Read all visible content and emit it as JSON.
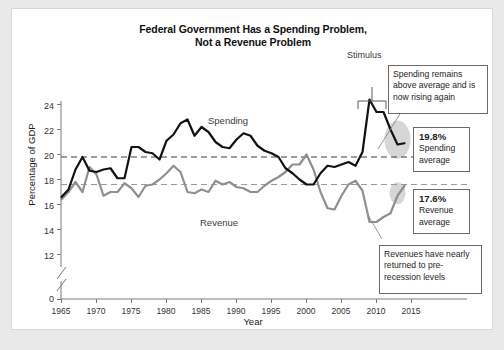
{
  "card": {
    "title_line1": "Federal Government Has a Spending Problem,",
    "title_line2": "Not a Revenue Problem"
  },
  "annotations": {
    "stimulus_label": "Stimulus",
    "spending_callout": "Spending remains above average and is now rising again",
    "revenue_callout": "Revenues have nearly returned to pre-recession levels",
    "spending_avg_value": "19.8%",
    "spending_avg_caption_l1": "Spending",
    "spending_avg_caption_l2": "average",
    "revenue_avg_value": "17.6%",
    "revenue_avg_caption_l1": "Revenue",
    "revenue_avg_caption_l2": "average"
  },
  "colors": {
    "spending_line": "#121212",
    "revenue_line": "#8f8f8f",
    "spending_avg_dash": "#3c3c3c",
    "revenue_avg_dash": "#9a9a9a",
    "axis": "#7a7a7a",
    "card_bg": "#ffffff",
    "page_bg": "#e9e9e9",
    "highlight_ellipse": "#c9c9c9"
  },
  "chart_data": {
    "type": "line",
    "title": "Federal Government Has a Spending Problem, Not a Revenue Problem",
    "xlabel": "Year",
    "ylabel": "Percentage of GDP",
    "xlim": [
      1965,
      2015
    ],
    "ylim": [
      12,
      24
    ],
    "y_axis_break": true,
    "grid": false,
    "legend": "inline-labels",
    "yticks": [
      "0",
      "12",
      "14",
      "16",
      "18",
      "20",
      "22",
      "24"
    ],
    "xticks": [
      "1965",
      "1970",
      "1975",
      "1980",
      "1985",
      "1990",
      "1995",
      "2000",
      "2005",
      "2010",
      "2015"
    ],
    "reference_lines": [
      {
        "name": "Spending average",
        "value": 19.8,
        "style": "dashed",
        "color": "#3c3c3c"
      },
      {
        "name": "Revenue average",
        "value": 17.6,
        "style": "dashed",
        "color": "#9a9a9a"
      }
    ],
    "x": [
      1965,
      1966,
      1967,
      1968,
      1969,
      1970,
      1971,
      1972,
      1973,
      1974,
      1975,
      1976,
      1977,
      1978,
      1979,
      1980,
      1981,
      1982,
      1983,
      1984,
      1985,
      1986,
      1987,
      1988,
      1989,
      1990,
      1991,
      1992,
      1993,
      1994,
      1995,
      1996,
      1997,
      1998,
      1999,
      2000,
      2001,
      2002,
      2003,
      2004,
      2005,
      2006,
      2007,
      2008,
      2009,
      2010,
      2011,
      2012,
      2013,
      2014
    ],
    "series": [
      {
        "name": "Spending",
        "color": "#121212",
        "values": [
          16.6,
          17.2,
          18.8,
          19.8,
          18.7,
          18.6,
          18.8,
          18.9,
          18.1,
          18.1,
          20.6,
          20.6,
          20.2,
          20.1,
          19.6,
          21.1,
          21.6,
          22.5,
          22.8,
          21.5,
          22.2,
          21.8,
          21.0,
          20.6,
          20.5,
          21.2,
          21.7,
          21.5,
          20.7,
          20.3,
          20.1,
          19.8,
          18.9,
          18.5,
          18.0,
          17.6,
          17.6,
          18.5,
          19.1,
          19.0,
          19.2,
          19.4,
          19.1,
          20.2,
          24.4,
          23.4,
          23.4,
          22.0,
          20.8,
          20.9
        ]
      },
      {
        "name": "Revenue",
        "color": "#8f8f8f",
        "values": [
          16.4,
          17.0,
          17.8,
          17.0,
          19.0,
          18.4,
          16.7,
          17.0,
          17.0,
          17.7,
          17.3,
          16.6,
          17.5,
          17.6,
          18.0,
          18.5,
          19.1,
          18.6,
          17.0,
          16.9,
          17.2,
          17.0,
          17.9,
          17.6,
          17.8,
          17.4,
          17.3,
          17.0,
          17.0,
          17.5,
          17.9,
          18.2,
          18.6,
          19.2,
          19.2,
          20.0,
          18.8,
          17.0,
          15.7,
          15.6,
          16.7,
          17.6,
          17.9,
          17.1,
          14.6,
          14.6,
          15.0,
          15.3,
          16.7,
          17.5
        ]
      }
    ]
  }
}
